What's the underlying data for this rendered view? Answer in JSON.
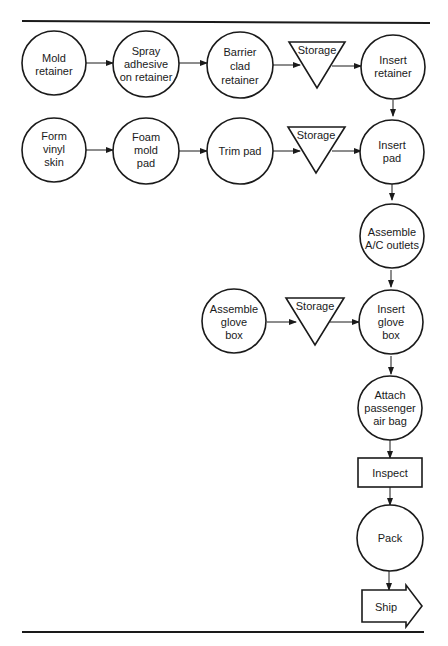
{
  "diagram": {
    "type": "process-flow-chart",
    "nodes": [
      {
        "id": "mold_retainer",
        "shape": "operation-circle",
        "lines": [
          "Mold",
          "retainer"
        ]
      },
      {
        "id": "spray_adhesive",
        "shape": "operation-circle",
        "lines": [
          "Spray",
          "adhesive",
          "on retainer"
        ]
      },
      {
        "id": "barrier_clad",
        "shape": "operation-circle",
        "lines": [
          "Barrier",
          "clad",
          "retainer"
        ]
      },
      {
        "id": "storage_1",
        "shape": "storage-triangle",
        "lines": [
          "Storage"
        ]
      },
      {
        "id": "insert_retainer",
        "shape": "operation-circle",
        "lines": [
          "Insert",
          "retainer"
        ]
      },
      {
        "id": "form_vinyl",
        "shape": "operation-circle",
        "lines": [
          "Form",
          "vinyl",
          "skin"
        ]
      },
      {
        "id": "foam_mold",
        "shape": "operation-circle",
        "lines": [
          "Foam",
          "mold",
          "pad"
        ]
      },
      {
        "id": "trim_pad",
        "shape": "operation-circle",
        "lines": [
          "Trim pad"
        ]
      },
      {
        "id": "storage_2",
        "shape": "storage-triangle",
        "lines": [
          "Storage"
        ]
      },
      {
        "id": "insert_pad",
        "shape": "operation-circle",
        "lines": [
          "Insert",
          "pad"
        ]
      },
      {
        "id": "assemble_ac",
        "shape": "operation-circle",
        "lines": [
          "Assemble",
          "A/C outlets"
        ]
      },
      {
        "id": "assemble_glove",
        "shape": "operation-circle",
        "lines": [
          "Assemble",
          "glove",
          "box"
        ]
      },
      {
        "id": "storage_3",
        "shape": "storage-triangle",
        "lines": [
          "Storage"
        ]
      },
      {
        "id": "insert_glove",
        "shape": "operation-circle",
        "lines": [
          "Insert",
          "glove",
          "box"
        ]
      },
      {
        "id": "attach_airbag",
        "shape": "operation-circle",
        "lines": [
          "Attach",
          "passenger",
          "air bag"
        ]
      },
      {
        "id": "inspect",
        "shape": "inspection-rectangle",
        "lines": [
          "Inspect"
        ]
      },
      {
        "id": "pack",
        "shape": "operation-circle",
        "lines": [
          "Pack"
        ]
      },
      {
        "id": "ship",
        "shape": "ship-arrow",
        "lines": [
          "Ship"
        ]
      }
    ],
    "edges": [
      [
        "mold_retainer",
        "spray_adhesive"
      ],
      [
        "spray_adhesive",
        "barrier_clad"
      ],
      [
        "barrier_clad",
        "storage_1"
      ],
      [
        "storage_1",
        "insert_retainer"
      ],
      [
        "insert_retainer",
        "insert_pad"
      ],
      [
        "form_vinyl",
        "foam_mold"
      ],
      [
        "foam_mold",
        "trim_pad"
      ],
      [
        "trim_pad",
        "storage_2"
      ],
      [
        "storage_2",
        "insert_pad"
      ],
      [
        "insert_pad",
        "assemble_ac"
      ],
      [
        "assemble_ac",
        "insert_glove"
      ],
      [
        "assemble_glove",
        "storage_3"
      ],
      [
        "storage_3",
        "insert_glove"
      ],
      [
        "insert_glove",
        "attach_airbag"
      ],
      [
        "attach_airbag",
        "inspect"
      ],
      [
        "inspect",
        "pack"
      ],
      [
        "pack",
        "ship"
      ]
    ]
  }
}
